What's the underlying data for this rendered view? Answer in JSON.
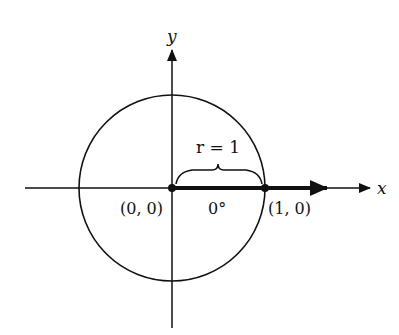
{
  "diagram": {
    "axes": {
      "x_label": "x",
      "y_label": "y"
    },
    "circle": {
      "radius_label": "r = 1"
    },
    "points": [
      {
        "name": "origin",
        "label": "(0, 0)"
      },
      {
        "name": "unit-point",
        "label": "(1, 0)"
      }
    ],
    "angle_label": "0°",
    "colors": {
      "stroke": "#111111",
      "background": "#ffffff"
    }
  }
}
